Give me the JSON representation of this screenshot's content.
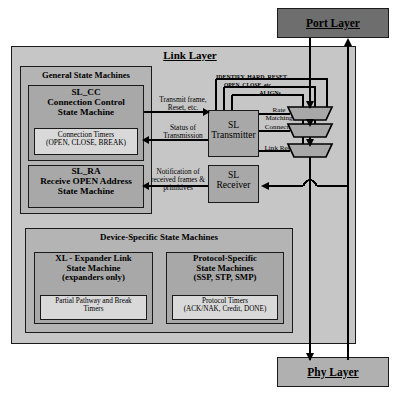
{
  "diagram": {
    "title_link_layer": "Link Layer",
    "port_layer": "Port Layer",
    "phy_layer": "Phy Layer",
    "general_sm": {
      "group_title": "General State Machines",
      "sl_cc": {
        "name": "SL_CC",
        "line2": "Connection Control",
        "line3": "State Machine",
        "timers_line1": "Connection Timers",
        "timers_line2": "(OPEN, CLOSE, BREAK)"
      },
      "sl_ra": {
        "name": "SL_RA",
        "line2": "Receive OPEN Address",
        "line3": "State Machine"
      }
    },
    "device_sm": {
      "group_title": "Device-Specific State Machines",
      "xl": {
        "line1": "XL - Expander Link",
        "line2": "State Machine",
        "line3": "(expanders only)",
        "timers_line1": "Partial Pathway and Break",
        "timers_line2": "Timers"
      },
      "protocol": {
        "line1": "Protocol-Specific",
        "line2": "State Machines",
        "line3": "(SSP, STP, SMP)",
        "timers_line1": "Protocol Timers",
        "timers_line2": "(ACK/NAK, Credit, DONE)"
      }
    },
    "transmitter": {
      "line1": "SL",
      "line2": "Transmitter"
    },
    "receiver": {
      "line1": "SL",
      "line2": "Receiver"
    },
    "signals": {
      "transmit_frame_l1": "Transmit frame,",
      "transmit_frame_l2": "Reset, etc.",
      "status_l1": "Status of",
      "status_l2": "Transmission",
      "notify_l1": "Notification of",
      "notify_l2": "received frames &",
      "notify_l3": "primitives"
    },
    "mux_feeds": {
      "identify_hard_reset": "IDENTIFY, HARD_RESET",
      "open_close_etc": "OPEN, CLOSE, etc.",
      "aligns": "ALIGNs"
    },
    "mux_labels": {
      "rate_l1": "Rate",
      "rate_l2": "Matching",
      "connected": "Connected",
      "link_reset": "Link Reset"
    },
    "colors": {
      "outer_fill": "#c6c6c6",
      "group_fill": "#b4b4b4",
      "inner_fill": "#a8a8a8",
      "timer_fill": "#d9d9d9",
      "port_layer_fill": "#6e6e6e",
      "phy_layer_fill": "#b0b0b0",
      "line": "#000000"
    }
  }
}
